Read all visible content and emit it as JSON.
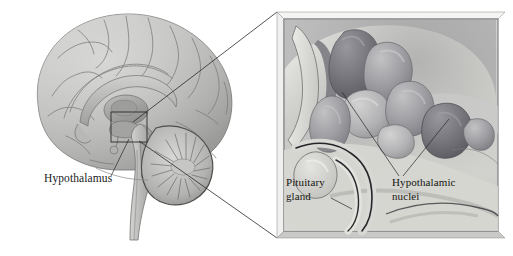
{
  "figure": {
    "background_color": "#ffffff",
    "width": 513,
    "height": 256
  },
  "overview": {
    "name": "midsagittal-brain-view",
    "description": "Grayscale midsagittal section of the human brain showing cerebral cortex, corpus callosum, thalamus, hypothalamus, cerebellum and brainstem",
    "labels": [
      {
        "id": "hypothalamus",
        "text": "Hypothalamus",
        "x": 44,
        "y": 182,
        "leader_from": [
          111,
          176
        ],
        "leader_to": [
          129,
          139
        ]
      }
    ],
    "source_box": {
      "name": "magnified-region-marker",
      "x": 111,
      "y": 112,
      "width": 36,
      "height": 30
    }
  },
  "detail": {
    "name": "magnified-hypothalamus-panel",
    "description": "Enlarged three-dimensional view of the hypothalamic nuclei, pituitary gland and surrounding structures",
    "frame": {
      "x": 277,
      "y": 12,
      "width": 228,
      "height": 226,
      "border_color": "#6a6a6e",
      "fill_color": "#dededa",
      "bevel_color": "#f2f2f0"
    },
    "labels": [
      {
        "id": "pituitary-gland",
        "lines": [
          "Pituitary",
          "gland"
        ],
        "x": 286,
        "y": 186,
        "leader_from": [
          331,
          198
        ],
        "leader_to": [
          352,
          209
        ]
      },
      {
        "id": "hypothalamic-nuclei",
        "lines": [
          "Hypothalamic",
          "nuclei"
        ],
        "x": 392,
        "y": 186,
        "leader_a_from": [
          399,
          176
        ],
        "leader_a_to": [
          342,
          92
        ],
        "leader_b_from": [
          403,
          176
        ],
        "leader_b_to": [
          449,
          119
        ]
      }
    ]
  },
  "connectors": {
    "name": "callout-connector-lines",
    "upper": {
      "from": [
        133,
        122
      ],
      "to": [
        277,
        12
      ]
    },
    "lower": {
      "from": [
        139,
        141
      ],
      "to": [
        277,
        238
      ]
    },
    "color": "#2a2a2e"
  },
  "colors": {
    "cortex_light": "#c2c2c0",
    "cortex_mid": "#a9a9a7",
    "cortex_shadow": "#8d8d8b",
    "outline": "#6f6f6f",
    "nuclei_dark": "#6e6e73",
    "nuclei_light": "#b6b6b8",
    "panel_bg": "#dededa",
    "text": "#1a1a1a"
  }
}
